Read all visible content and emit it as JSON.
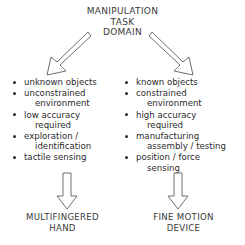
{
  "diagram": {
    "title": {
      "lines": [
        "MANIPULATION",
        "TASK",
        "DOMAIN"
      ]
    },
    "arrows": {
      "left_diagonal": "arrow-down-left",
      "right_diagonal": "arrow-down-right",
      "left_vertical": "arrow-down",
      "right_vertical": "arrow-down"
    },
    "left_branch": {
      "items": [
        {
          "lines": [
            "unknown objects"
          ]
        },
        {
          "lines": [
            "unconstrained",
            "environment"
          ]
        },
        {
          "lines": [
            "low accuracy",
            "required"
          ]
        },
        {
          "lines": [
            "exploration /",
            "identification"
          ]
        },
        {
          "lines": [
            "tactile sensing"
          ]
        }
      ],
      "outcome": {
        "lines": [
          "MULTIFINGERED",
          "HAND"
        ]
      }
    },
    "right_branch": {
      "items": [
        {
          "lines": [
            "known objects"
          ]
        },
        {
          "lines": [
            "constrained",
            "environment"
          ]
        },
        {
          "lines": [
            "high accuracy",
            "required"
          ]
        },
        {
          "lines": [
            "manufacturing",
            "assembly / testing"
          ]
        },
        {
          "lines": [
            "position / force",
            "sensing"
          ]
        }
      ],
      "outcome": {
        "lines": [
          "FINE MOTION",
          "DEVICE"
        ]
      }
    },
    "colors": {
      "background": "#ffffff",
      "text": "#2b2b2b",
      "heading_text": "#3a3a3a",
      "arrow_stroke": "#6e6e6e"
    }
  }
}
